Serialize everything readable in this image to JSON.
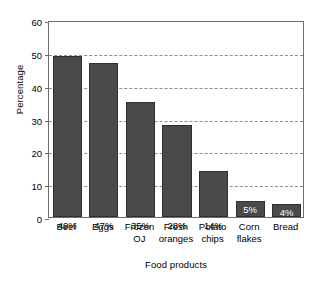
{
  "chart_data": {
    "type": "bar",
    "title": "",
    "xlabel": "Food products",
    "ylabel": "Percentage",
    "categories": [
      "Beef",
      "Eggs",
      "Frozen OJ",
      "Fresh oranges",
      "Potato chips",
      "Corn flakes",
      "Bread"
    ],
    "category_lines": [
      [
        "Beef"
      ],
      [
        "Eggs"
      ],
      [
        "Frozen",
        "OJ"
      ],
      [
        "Fresh",
        "oranges"
      ],
      [
        "Potato",
        "chips"
      ],
      [
        "Corn",
        "flakes"
      ],
      [
        "Bread"
      ]
    ],
    "values": [
      49,
      47,
      35,
      28,
      14,
      5,
      4
    ],
    "value_labels": [
      "49%",
      "47%",
      "35%",
      "28%",
      "14%",
      "5%",
      "4%"
    ],
    "label_placement": [
      "inside-dark",
      "inside-dark",
      "inside-dark",
      "inside-dark",
      "inside-dark",
      "inside-light",
      "inside-light"
    ],
    "ylim": [
      0,
      60
    ],
    "yticks": [
      0,
      10,
      20,
      30,
      40,
      50,
      60
    ],
    "ytick_labels": [
      "0",
      "10",
      "20",
      "30",
      "40",
      "50",
      "60"
    ],
    "grid": true,
    "grid_style": "dashed",
    "legend": false,
    "bar_color": "#4a4a4a",
    "bar_edge_color": "#2f2f2f",
    "grid_color": "#8e8e8e",
    "frame_color": "#6e6e6e",
    "background": "#ffffff"
  }
}
